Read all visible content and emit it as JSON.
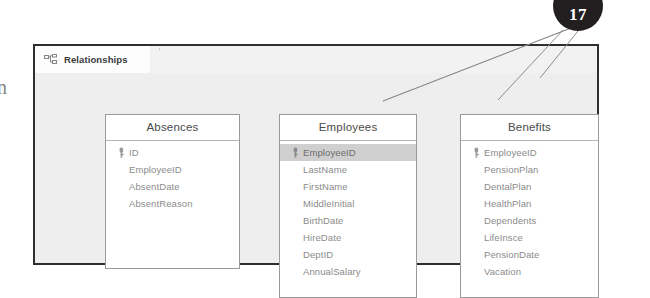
{
  "window": {
    "tab": {
      "label": "Relationships",
      "icon": "relationships-icon"
    }
  },
  "edge_glyph": "n",
  "callout": {
    "number": "17",
    "color": "#231f20"
  },
  "tables": [
    {
      "id": "absences",
      "title": "Absences",
      "fields": [
        {
          "name": "ID",
          "key": true,
          "selected": false
        },
        {
          "name": "EmployeeID",
          "key": false,
          "selected": false
        },
        {
          "name": "AbsentDate",
          "key": false,
          "selected": false
        },
        {
          "name": "AbsentReason",
          "key": false,
          "selected": false
        }
      ]
    },
    {
      "id": "employees",
      "title": "Employees",
      "fields": [
        {
          "name": "EmployeeID",
          "key": true,
          "selected": true
        },
        {
          "name": "LastName",
          "key": false,
          "selected": false
        },
        {
          "name": "FirstName",
          "key": false,
          "selected": false
        },
        {
          "name": "MiddleInitial",
          "key": false,
          "selected": false
        },
        {
          "name": "BirthDate",
          "key": false,
          "selected": false
        },
        {
          "name": "HireDate",
          "key": false,
          "selected": false
        },
        {
          "name": "DeptID",
          "key": false,
          "selected": false
        },
        {
          "name": "AnnualSalary",
          "key": false,
          "selected": false
        }
      ]
    },
    {
      "id": "benefits",
      "title": "Benefits",
      "fields": [
        {
          "name": "EmployeeID",
          "key": true,
          "selected": false
        },
        {
          "name": "PensionPlan",
          "key": false,
          "selected": false
        },
        {
          "name": "DentalPlan",
          "key": false,
          "selected": false
        },
        {
          "name": "HealthPlan",
          "key": false,
          "selected": false
        },
        {
          "name": "Dependents",
          "key": false,
          "selected": false
        },
        {
          "name": "LifeInsce",
          "key": false,
          "selected": false
        },
        {
          "name": "PensionDate",
          "key": false,
          "selected": false
        },
        {
          "name": "Vacation",
          "key": false,
          "selected": false
        }
      ]
    }
  ]
}
